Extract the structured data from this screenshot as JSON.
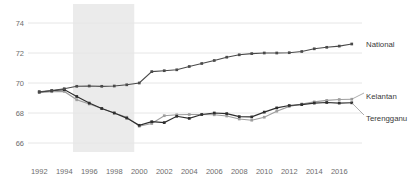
{
  "chart_data": {
    "type": "line",
    "title": "",
    "xlabel": "",
    "ylabel": "",
    "xlim": [
      1991.5,
      2017.5
    ],
    "ylim": [
      65.4,
      74.6
    ],
    "grid": true,
    "gridlines_y": [
      66,
      68,
      70,
      72,
      74
    ],
    "legend_position": "right-inline",
    "x": [
      1992,
      1993,
      1994,
      1995,
      1996,
      1997,
      1998,
      1999,
      2000,
      2001,
      2002,
      2003,
      2004,
      2005,
      2006,
      2007,
      2008,
      2009,
      2010,
      2011,
      2012,
      2013,
      2014,
      2015,
      2016,
      2017
    ],
    "y_ticks": [
      "66",
      "68",
      "70",
      "72",
      "74"
    ],
    "x_ticks": [
      "1992",
      "1994",
      "1996",
      "1998",
      "2000",
      "2002",
      "2004",
      "2006",
      "2008",
      "2010",
      "2012",
      "2014",
      "2016"
    ],
    "series": [
      {
        "name": "National",
        "color": "#4a4a4a",
        "marker": "square",
        "values": [
          69.42,
          69.5,
          69.62,
          69.78,
          69.8,
          69.78,
          69.8,
          69.88,
          70.0,
          70.76,
          70.82,
          70.88,
          71.1,
          71.3,
          71.5,
          71.72,
          71.88,
          71.96,
          72.0,
          72.0,
          72.02,
          72.1,
          72.28,
          72.38,
          72.46,
          72.6
        ]
      },
      {
        "name": "Kelantan",
        "color": "#9e9e9e",
        "marker": "square",
        "values": [
          69.36,
          69.42,
          69.44,
          68.88,
          68.6,
          68.3,
          68.0,
          67.72,
          67.12,
          67.3,
          67.82,
          67.88,
          67.9,
          67.9,
          67.88,
          67.8,
          67.6,
          67.52,
          67.72,
          68.12,
          68.44,
          68.6,
          68.74,
          68.84,
          68.9,
          68.92
        ]
      },
      {
        "name": "Terengganu",
        "color": "#2e2e2e",
        "marker": "square",
        "values": [
          69.4,
          69.48,
          69.56,
          69.1,
          68.66,
          68.3,
          68.0,
          67.66,
          67.18,
          67.42,
          67.36,
          67.78,
          67.64,
          67.9,
          68.0,
          67.96,
          67.76,
          67.74,
          68.06,
          68.34,
          68.5,
          68.56,
          68.66,
          68.7,
          68.66,
          68.68
        ]
      }
    ],
    "shaded_band": {
      "name": "highlight-band",
      "x_start": 1994.7,
      "x_end": 1999.6,
      "color": "#ebebeb"
    },
    "colors": {
      "gridline": "#e6e6e6",
      "background": "#ffffff",
      "tick_text": "#6d6d6d",
      "label_text": "#3a3a3a"
    }
  }
}
